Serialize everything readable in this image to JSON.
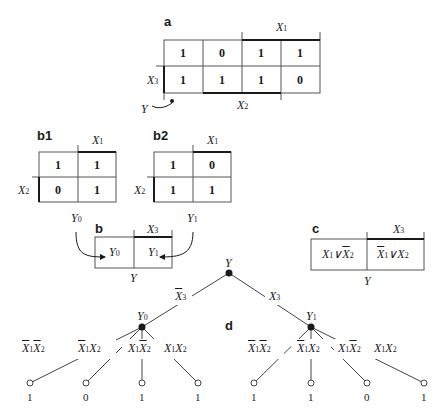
{
  "panels": {
    "a": {
      "label": "a",
      "cells": [
        [
          "1",
          "0",
          "1",
          "1"
        ],
        [
          "1",
          "1",
          "1",
          "0"
        ]
      ],
      "top_var": "X1",
      "left_var": "X3",
      "bottom_var": "X2",
      "output": "Y"
    },
    "b1": {
      "label": "b1",
      "cells": [
        [
          "1",
          "1"
        ],
        [
          "0",
          "1"
        ]
      ],
      "top_var": "X1",
      "left_var": "X2",
      "output": "Y0"
    },
    "b2": {
      "label": "b2",
      "cells": [
        [
          "1",
          "0"
        ],
        [
          "1",
          "1"
        ]
      ],
      "top_var": "X1",
      "left_var": "X2",
      "output": "Y1"
    },
    "b": {
      "label": "b",
      "cells": [
        "Y0",
        "Y1"
      ],
      "top_var": "X3",
      "output": "Y"
    },
    "c": {
      "label": "c",
      "cells": [
        "X1 ∨ ¬X2",
        "¬X1 ∨ X2"
      ],
      "top_var": "X3",
      "output": "Y"
    },
    "d": {
      "label": "d",
      "root": "Y",
      "branches": [
        {
          "edge": "¬X3",
          "node": "Y0",
          "children": [
            {
              "edge": "¬X1¬X2",
              "value": "1"
            },
            {
              "edge": "¬X1X2",
              "value": "0"
            },
            {
              "edge": "X1¬X2",
              "value": "1"
            },
            {
              "edge": "X1X2",
              "value": "1"
            }
          ]
        },
        {
          "edge": "X3",
          "node": "Y1",
          "children": [
            {
              "edge": "¬X1¬X2",
              "value": "1"
            },
            {
              "edge": "¬X1X2",
              "value": "1"
            },
            {
              "edge": "X1¬X2",
              "value": "0"
            },
            {
              "edge": "X1X2",
              "value": "1"
            }
          ]
        }
      ]
    }
  }
}
